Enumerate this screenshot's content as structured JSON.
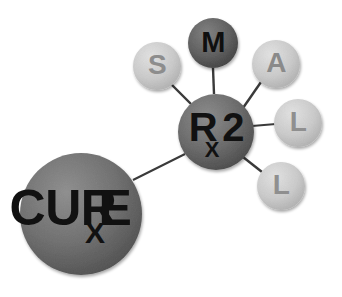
{
  "diagram": {
    "type": "node-link-diagram",
    "background_color": "#ffffff",
    "width": 342,
    "height": 297,
    "edge_color": "#3a3a3a",
    "edge_width": 2,
    "acronym_reading": "SMALL",
    "nodes": [
      {
        "id": "cure",
        "name": "cure-node",
        "label_main": "CUR",
        "label_sub": "X",
        "label_tail": "E",
        "full_text": "CURxE",
        "cx": 81,
        "cy": 214,
        "r": 61,
        "fill": "#6e6e6e",
        "fill_light": "#8a8a8a",
        "fill_dark": "#4a4a4a",
        "text_color": "#111111",
        "font_size": 52,
        "sub_font_size": 30
      },
      {
        "id": "rx2",
        "name": "rx2-node",
        "label_main": "R",
        "label_sub": "X",
        "label_tail": "2",
        "full_text": "Rx2",
        "cx": 216,
        "cy": 132,
        "r": 38,
        "fill": "#6a6a6a",
        "fill_light": "#858585",
        "fill_dark": "#474747",
        "text_color": "#111111",
        "font_size": 38,
        "sub_font_size": 22
      },
      {
        "id": "s",
        "name": "node-s",
        "label_main": "S",
        "cx": 157,
        "cy": 66,
        "r": 24,
        "fill": "#c9c9c9",
        "fill_light": "#dcdcdc",
        "fill_dark": "#b0b0b0",
        "text_color": "#8d8d8d",
        "font_size": 28
      },
      {
        "id": "m",
        "name": "node-m",
        "label_main": "M",
        "cx": 213,
        "cy": 43,
        "r": 25,
        "fill": "#606060",
        "fill_light": "#7d7d7d",
        "fill_dark": "#3e3e3e",
        "text_color": "#0f0f0f",
        "font_size": 29
      },
      {
        "id": "a",
        "name": "node-a",
        "label_main": "A",
        "cx": 276,
        "cy": 64,
        "r": 24,
        "fill": "#c6c6c6",
        "fill_light": "#dadada",
        "fill_dark": "#adadad",
        "text_color": "#8a8a8a",
        "font_size": 28
      },
      {
        "id": "l1",
        "name": "node-l-upper",
        "label_main": "L",
        "cx": 298,
        "cy": 123,
        "r": 24,
        "fill": "#cccccc",
        "fill_light": "#e0e0e0",
        "fill_dark": "#b3b3b3",
        "text_color": "#8f8f8f",
        "font_size": 28
      },
      {
        "id": "l2",
        "name": "node-l-lower",
        "label_main": "L",
        "cx": 281,
        "cy": 186,
        "r": 24,
        "fill": "#cccccc",
        "fill_light": "#e0e0e0",
        "fill_dark": "#b3b3b3",
        "text_color": "#8f8f8f",
        "font_size": 28
      }
    ],
    "edges": [
      {
        "id": "edge-cure-rx2",
        "name": "edge-cure-rx2",
        "from": "cure",
        "to": "rx2",
        "x1": 133,
        "y1": 180,
        "x2": 185,
        "y2": 154
      },
      {
        "id": "edge-rx2-s",
        "name": "edge-rx2-s",
        "from": "rx2",
        "to": "s",
        "x1": 191,
        "y1": 104,
        "x2": 172,
        "y2": 85
      },
      {
        "id": "edge-rx2-m",
        "name": "edge-rx2-m",
        "from": "rx2",
        "to": "m",
        "x1": 214,
        "y1": 94,
        "x2": 213,
        "y2": 68
      },
      {
        "id": "edge-rx2-a",
        "name": "edge-rx2-a",
        "from": "rx2",
        "to": "a",
        "x1": 243,
        "y1": 108,
        "x2": 261,
        "y2": 82
      },
      {
        "id": "edge-rx2-l1",
        "name": "edge-rx2-l1",
        "from": "rx2",
        "to": "l1",
        "x1": 254,
        "y1": 126,
        "x2": 274,
        "y2": 124
      },
      {
        "id": "edge-rx2-l2",
        "name": "edge-rx2-l2",
        "from": "rx2",
        "to": "l2",
        "x1": 243,
        "y1": 157,
        "x2": 261,
        "y2": 173
      }
    ]
  }
}
